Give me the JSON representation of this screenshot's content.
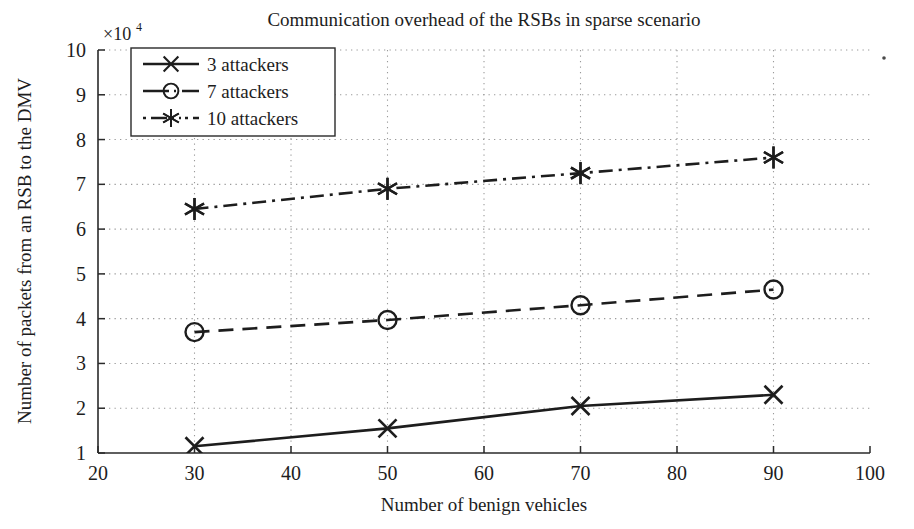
{
  "figure": {
    "title": "Communication overhead of the RSBs in sparse scenario",
    "y_multiplier_base": "×10",
    "y_multiplier_exp": "4",
    "background_color": "#ffffff",
    "ink_color": "#1d1d1d",
    "grid_color": "#9a9a9a"
  },
  "axes": {
    "x_title": "Number of benign vehicles",
    "y_title": "Number of packets from an RSB to the DMV",
    "x_ticks": [
      "20",
      "30",
      "40",
      "50",
      "60",
      "70",
      "80",
      "90",
      "100"
    ],
    "y_ticks": [
      "1",
      "2",
      "3",
      "4",
      "5",
      "6",
      "7",
      "8",
      "9",
      "10"
    ]
  },
  "legend": {
    "entries": [
      {
        "label": "3 attackers",
        "marker": "cross-marker",
        "dash": "solid"
      },
      {
        "label": "7 attackers",
        "marker": "circle-marker",
        "dash": "dashed"
      },
      {
        "label": "10 attackers",
        "marker": "asterisk-marker",
        "dash": "dashdot"
      }
    ]
  },
  "chart_data": {
    "type": "line",
    "title": "Communication overhead of the RSBs in sparse scenario",
    "xlabel": "Number of benign vehicles",
    "ylabel": "Number of packets from an RSB to the DMV",
    "y_scale_multiplier": 10000,
    "y_multiplier_label": "×10^4",
    "x": [
      30,
      50,
      70,
      90
    ],
    "xlim": [
      20,
      100
    ],
    "ylim": [
      1,
      10
    ],
    "xticks": [
      20,
      30,
      40,
      50,
      60,
      70,
      80,
      90,
      100
    ],
    "yticks": [
      1,
      2,
      3,
      4,
      5,
      6,
      7,
      8,
      9,
      10
    ],
    "grid": true,
    "legend_position": "upper-left-inside",
    "series": [
      {
        "name": "3 attackers",
        "marker": "x",
        "linestyle": "solid",
        "values": [
          1.15,
          1.55,
          2.05,
          2.3
        ]
      },
      {
        "name": "7 attackers",
        "marker": "o",
        "linestyle": "dashed",
        "values": [
          3.7,
          3.97,
          4.3,
          4.65
        ]
      },
      {
        "name": "10 attackers",
        "marker": "*",
        "linestyle": "dashdot",
        "values": [
          6.45,
          6.9,
          7.25,
          7.6
        ]
      }
    ]
  }
}
